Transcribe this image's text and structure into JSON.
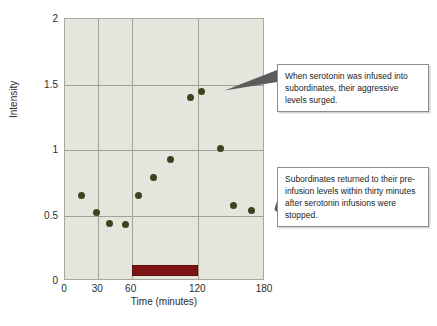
{
  "chart_data": {
    "type": "scatter",
    "title": "",
    "xlabel": "Time (minutes)",
    "ylabel": "Intensity",
    "xlim": [
      0,
      180
    ],
    "ylim": [
      0,
      2
    ],
    "grid": true,
    "legend": "none",
    "xticks": [
      {
        "value": 0,
        "label": "0"
      },
      {
        "value": 30,
        "label": "30"
      },
      {
        "value": 60,
        "label": "60"
      },
      {
        "value": 120,
        "label": "120"
      },
      {
        "value": 180,
        "label": "180"
      }
    ],
    "gridlines_x": [
      30,
      60,
      120
    ],
    "yticks": [
      {
        "value": 0,
        "label": "0"
      },
      {
        "value": 0.5,
        "label": "0.5"
      },
      {
        "value": 1,
        "label": "1"
      },
      {
        "value": 1.5,
        "label": "1.5"
      },
      {
        "value": 2,
        "label": "2"
      }
    ],
    "gridlines_y": [
      0.5,
      1,
      1.5
    ],
    "series": [
      {
        "name": "Aggression intensity",
        "marker": "circle",
        "color": "#3c441f",
        "points": [
          {
            "x": 15,
            "y": 0.65
          },
          {
            "x": 28,
            "y": 0.52
          },
          {
            "x": 40,
            "y": 0.44
          },
          {
            "x": 54,
            "y": 0.43
          },
          {
            "x": 66,
            "y": 0.65
          },
          {
            "x": 80,
            "y": 0.79
          },
          {
            "x": 95,
            "y": 0.93
          },
          {
            "x": 113,
            "y": 1.4
          },
          {
            "x": 123,
            "y": 1.45
          },
          {
            "x": 140,
            "y": 1.01
          },
          {
            "x": 152,
            "y": 0.58
          },
          {
            "x": 168,
            "y": 0.54
          }
        ]
      }
    ],
    "spans": [
      {
        "name": "serotonin-infusion-period",
        "x_start": 60,
        "x_end": 120,
        "y_start": 0.04,
        "y_end": 0.12,
        "color": "#7c1414"
      }
    ],
    "annotations": [
      {
        "id": "callout-1",
        "text": "When serotonin was infused into subordinates, their aggressive levels surged.",
        "target": {
          "x": 123,
          "y": 1.45
        }
      },
      {
        "id": "callout-2",
        "text": "Subordinates returned to their pre-infusion levels within thirty minutes after serotonin infusions were stopped.",
        "target": {
          "x": 168,
          "y": 0.54
        }
      }
    ]
  },
  "colors": {
    "plot_background": "#e4e6dd",
    "gridline": "#9fa392",
    "axis_border": "#a8ab9c",
    "marker": "#3c441f",
    "infusion_bar": "#7c1414",
    "callout_border": "#8d8d8d",
    "page_background": "#ffffff",
    "text": "#1d1d1d"
  }
}
